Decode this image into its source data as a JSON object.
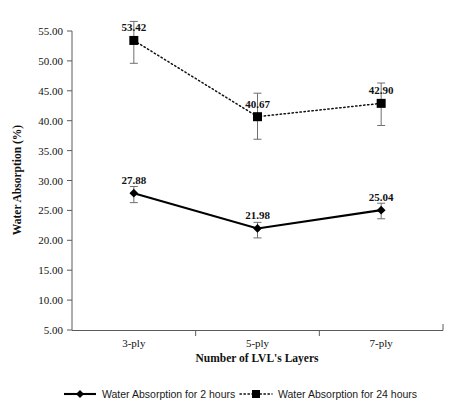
{
  "chart_data": {
    "type": "line",
    "title": "",
    "xlabel": "Number of LVL's Layers",
    "ylabel": "Water Absorption (%)",
    "categories": [
      "3-ply",
      "5-ply",
      "7-ply"
    ],
    "ylim": [
      5.0,
      55.0
    ],
    "ytick_step": 5.0,
    "ytick_labels": [
      "5.00",
      "10.00",
      "15.00",
      "20.00",
      "25.00",
      "30.00",
      "35.00",
      "40.00",
      "45.00",
      "50.00",
      "55.00"
    ],
    "ytick_values": [
      5.0,
      10.0,
      15.0,
      20.0,
      25.0,
      30.0,
      35.0,
      40.0,
      45.0,
      50.0,
      55.0
    ],
    "grid": false,
    "legend_position": "bottom",
    "series": [
      {
        "name": "Water Absorption for 2 hours",
        "line_style": "solid",
        "marker": "diamond",
        "color": "#000000",
        "values": [
          27.88,
          21.98,
          25.04
        ],
        "value_labels": [
          "27.88",
          "21.98",
          "25.04"
        ],
        "error_low": [
          26.3,
          20.4,
          23.6
        ],
        "error_high": [
          29.0,
          23.0,
          26.2
        ]
      },
      {
        "name": "Water Absorption for 24 hours",
        "line_style": "dotted",
        "marker": "square",
        "color": "#111111",
        "values": [
          53.42,
          40.67,
          42.9
        ],
        "value_labels": [
          "53.42",
          "40.67",
          "42.90"
        ],
        "error_low": [
          49.6,
          36.9,
          39.2
        ],
        "error_high": [
          56.6,
          44.6,
          46.3
        ]
      }
    ]
  },
  "legend": {
    "items": [
      {
        "label": "Water Absorption for 2 hours",
        "style": "solid-diamond"
      },
      {
        "label": "Water Absorption for 24 hours",
        "style": "dotted-square"
      }
    ]
  },
  "colors": {
    "axis": "#5a5a5a",
    "series_primary": "#000000",
    "series_secondary": "#111111",
    "error_bar": "#6f6f6f",
    "background": "#ffffff"
  }
}
